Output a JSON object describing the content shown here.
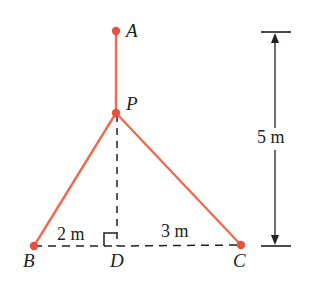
{
  "figure": {
    "type": "geometry-diagram",
    "colors": {
      "cable": "#ee6c4d",
      "node": "#e8503a",
      "guide": "#231f20",
      "text": "#231f20",
      "background": "#ffffff"
    },
    "points": [
      {
        "id": "A",
        "label": "A",
        "x": 116,
        "y": 31,
        "label_x": 126,
        "label_y": 22,
        "dot": true
      },
      {
        "id": "P",
        "label": "P",
        "x": 116,
        "y": 113,
        "label_x": 126,
        "label_y": 95,
        "dot": true
      },
      {
        "id": "B",
        "label": "B",
        "x": 34,
        "y": 246,
        "label_x": 24,
        "label_y": 252,
        "dot": true
      },
      {
        "id": "D",
        "label": "D",
        "x": 117,
        "y": 246,
        "label_x": 111,
        "label_y": 252,
        "dot": false
      },
      {
        "id": "C",
        "label": "C",
        "x": 241,
        "y": 245,
        "label_x": 234,
        "label_y": 252,
        "dot": true
      }
    ],
    "segments": [
      {
        "id": "AP",
        "from": "A",
        "to": "P",
        "style": "solid",
        "color": "cable"
      },
      {
        "id": "PB",
        "from": "P",
        "to": "B",
        "style": "solid",
        "color": "cable"
      },
      {
        "id": "PC",
        "from": "P",
        "to": "C",
        "style": "solid",
        "color": "cable"
      },
      {
        "id": "PD",
        "from": "P",
        "to": "D",
        "style": "dashed",
        "color": "guide"
      },
      {
        "id": "BD",
        "from": "B",
        "to": "D",
        "style": "dashed",
        "color": "guide"
      },
      {
        "id": "DC",
        "from": "D",
        "to": "C",
        "style": "dashed",
        "color": "guide"
      }
    ],
    "right_angle": {
      "at": "D",
      "side": "left",
      "size": 13
    },
    "dimensions": [
      {
        "id": "BD",
        "label": "2 m",
        "label_x": 57,
        "label_y": 225,
        "between": [
          "B",
          "D"
        ]
      },
      {
        "id": "DC",
        "label": "3 m",
        "label_x": 161,
        "label_y": 223,
        "between": [
          "D",
          "C"
        ]
      },
      {
        "id": "AD-vertical",
        "label": "5 m",
        "label_x": 257,
        "label_y": 128,
        "orientation": "vertical",
        "axis_x": 275,
        "top_y": 32,
        "bottom_y": 246,
        "tick_half_width": 14,
        "arrows": "both"
      }
    ]
  }
}
